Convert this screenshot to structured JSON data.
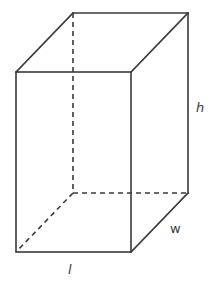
{
  "figure": {
    "type": "rectangular-prism",
    "stroke_color": "#3a3a3a",
    "vertices": {
      "front_top_left": [
        16,
        72
      ],
      "front_top_right": [
        131,
        72
      ],
      "front_bottom_left": [
        16,
        252
      ],
      "front_bottom_right": [
        131,
        252
      ],
      "back_top_left": [
        73,
        13
      ],
      "back_top_right": [
        188,
        13
      ],
      "back_bottom_left": [
        73,
        193
      ],
      "back_bottom_right": [
        188,
        193
      ]
    },
    "labels": {
      "height": "h",
      "width": "w",
      "length": "l"
    }
  }
}
